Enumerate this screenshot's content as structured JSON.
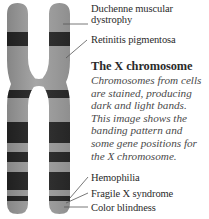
{
  "figure": {
    "title": "The X chromosome",
    "caption_lines": [
      "Chromosomes from cells",
      "are stained, producing",
      "dark and light bands.",
      "This image shows the",
      "banding pattern and",
      "some gene positions for",
      "the X chromosome."
    ],
    "gene_labels": [
      {
        "lines": [
          "Duchenne muscular",
          "dystrophy"
        ],
        "position": "short arm, upper"
      },
      {
        "lines": [
          "Retinitis pigmentosa"
        ],
        "position": "short arm, lower"
      },
      {
        "lines": [
          "Hemophilia"
        ],
        "position": "long arm, near tip"
      },
      {
        "lines": [
          "Fragile X syndrome"
        ],
        "position": "long arm, near tip"
      },
      {
        "lines": [
          "Color blindness"
        ],
        "position": "long arm, tip"
      }
    ],
    "colors": {
      "light_band": "#9c9c9c",
      "dark_band": "#262626",
      "leader_line": "#555555",
      "text": "#2a2a2a"
    }
  }
}
